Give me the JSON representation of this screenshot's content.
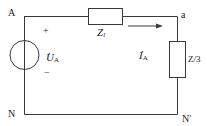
{
  "diagram": {
    "type": "circuit",
    "nodes": {
      "A": "A",
      "a": "a",
      "N": "N",
      "N_prime": "N′"
    },
    "source": {
      "symbol": "U",
      "subscript": "A",
      "plus": "+",
      "minus": "−"
    },
    "line_impedance": {
      "symbol": "Z",
      "subscript": "l"
    },
    "load_impedance": {
      "label": "Z/3"
    },
    "current": {
      "symbol": "I",
      "subscript": "A"
    },
    "colors": {
      "wire": "#3a3a3a",
      "text": "#1a1a1a",
      "background": "#ffffff"
    }
  }
}
